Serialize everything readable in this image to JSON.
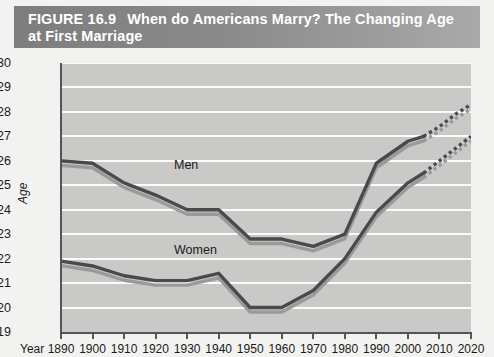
{
  "figure": {
    "number_label": "FIGURE 16.9",
    "title_line1": "When do Americans Marry? The Changing Age",
    "title_line2": "at First Marriage",
    "banner_color": "#8a8a8a",
    "banner_text_color": "#ffffff"
  },
  "axes": {
    "y_axis_title": "Age",
    "x_axis_title": "Year",
    "y_ticks": [
      "30",
      "29",
      "28",
      "27",
      "26",
      "25",
      "24",
      "23",
      "22",
      "21",
      "20",
      "19"
    ],
    "x_ticks": [
      "1890",
      "1900",
      "1910",
      "1920",
      "1930",
      "1940",
      "1950",
      "1960",
      "1970",
      "1980",
      "1990",
      "2000",
      "2010",
      "2020"
    ]
  },
  "series_labels": {
    "men": "Men",
    "women": "Women"
  },
  "colors": {
    "plot_background": "#c9c9c7",
    "gridline": "#fbfbfa",
    "line_primary": "#4a4a4a",
    "line_shadow": "#9a9a98",
    "axis": "#555555",
    "page_background": "#f2f2f0"
  },
  "chart_data": {
    "type": "line",
    "title": "When do Americans Marry? The Changing Age at First Marriage",
    "subtitle": "FIGURE 16.9",
    "xlabel": "Year",
    "ylabel": "Age",
    "xlim": [
      1890,
      2020
    ],
    "ylim": [
      19,
      30
    ],
    "grid": true,
    "legend_position": "inline-annotation",
    "x": [
      1890,
      1900,
      1910,
      1920,
      1930,
      1940,
      1950,
      1960,
      1970,
      1980,
      1990,
      2000,
      2005
    ],
    "series": [
      {
        "name": "Men",
        "values": [
          26.0,
          25.9,
          25.1,
          24.6,
          24.0,
          24.0,
          22.8,
          22.8,
          22.5,
          23.0,
          25.9,
          26.8,
          27.0
        ],
        "projection_x": [
          2005,
          2010,
          2015,
          2020
        ],
        "projection_values": [
          27.0,
          27.4,
          27.9,
          28.3
        ],
        "projection_style": "dotted"
      },
      {
        "name": "Women",
        "values": [
          21.9,
          21.7,
          21.3,
          21.1,
          21.1,
          21.4,
          20.0,
          20.0,
          20.7,
          22.0,
          23.9,
          25.1,
          25.5
        ],
        "projection_x": [
          2005,
          2010,
          2015,
          2020
        ],
        "projection_values": [
          25.5,
          26.0,
          26.5,
          27.0
        ],
        "projection_style": "dotted"
      }
    ]
  }
}
